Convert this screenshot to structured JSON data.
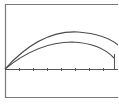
{
  "diagram": {
    "colors": {
      "background": "#ffffff",
      "frame": "#7a7a7a",
      "curve": "#4a4a4a",
      "axis": "#555555"
    },
    "frame": {
      "x": 5,
      "y": 4,
      "right_edge_visible": false,
      "bottom": 97
    },
    "axis": {
      "y": 69,
      "x_start": 5,
      "x_end": 118,
      "ticks_x": [
        19,
        33,
        47,
        61,
        75,
        89,
        103
      ]
    },
    "curves": [
      {
        "name": "upper-trajectory",
        "start": [
          5,
          69
        ],
        "peak": [
          78,
          32
        ],
        "end": [
          118,
          44
        ]
      },
      {
        "name": "lower-trajectory",
        "start": [
          5,
          69
        ],
        "peak": [
          72,
          42
        ],
        "end": [
          114,
          58
        ]
      }
    ],
    "marker": {
      "name": "landing-marker",
      "x": 114,
      "y_top": 54,
      "y_bottom": 69
    }
  }
}
